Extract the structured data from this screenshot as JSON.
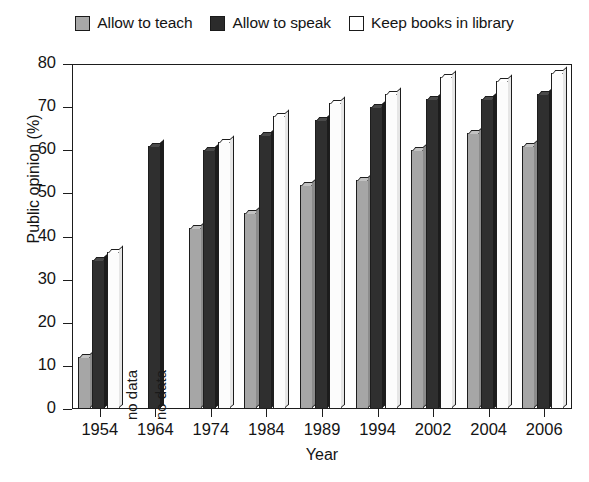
{
  "chart_data": {
    "type": "bar",
    "title": "",
    "xlabel": "Year",
    "ylabel": "Public opinion (%)",
    "ylim": [
      0,
      80
    ],
    "ytick_step": 10,
    "yticks": [
      0,
      10,
      20,
      30,
      40,
      50,
      60,
      70,
      80
    ],
    "grid": false,
    "legend_position": "top",
    "categories": [
      "1954",
      "1964",
      "1974",
      "1984",
      "1989",
      "1994",
      "2002",
      "2004",
      "2006"
    ],
    "no_data_label": "no data",
    "series": [
      {
        "name": "Allow to teach",
        "color": "#a6a6a6",
        "values": [
          12,
          null,
          42,
          45.5,
          52,
          53,
          60,
          64,
          61
        ]
      },
      {
        "name": "Allow to speak",
        "color": "#2f2f2f",
        "values": [
          34.5,
          61,
          60,
          63.5,
          67,
          70,
          72,
          72,
          73
        ]
      },
      {
        "name": "Keep books in library",
        "color": "#ffffff",
        "values": [
          36.5,
          null,
          62,
          68,
          71,
          73,
          77,
          76,
          78
        ]
      }
    ]
  },
  "legend": {
    "items": [
      {
        "label": "Allow to teach",
        "swatch": "sw-teach"
      },
      {
        "label": "Allow to speak",
        "swatch": "sw-speak"
      },
      {
        "label": "Keep books in library",
        "swatch": "sw-library"
      }
    ]
  },
  "axes": {
    "y_title": "Public opinion (%)",
    "x_title": "Year"
  }
}
